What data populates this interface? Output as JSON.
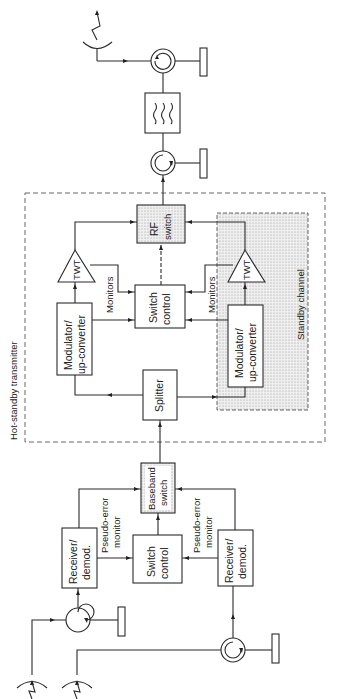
{
  "diagram": {
    "type": "block-diagram",
    "orientation": "rotated-90",
    "groups": {
      "hot_standby": "Hot-standby transmitter",
      "standby_channel": "Standby channel"
    },
    "blocks": {
      "rf_switch": [
        "RF",
        "switch"
      ],
      "switch_control_tx": [
        "Switch",
        "control"
      ],
      "twt_main": "TWT",
      "twt_standby": "TWT",
      "modulator_main": [
        "Modulator/",
        "up-converter"
      ],
      "modulator_standby": [
        "Modulator/",
        "up-converter"
      ],
      "splitter": "Splitter",
      "baseband_switch": [
        "Baseband",
        "switch"
      ],
      "switch_control_rx": [
        "Switch",
        "control"
      ],
      "receiver_main": [
        "Receiver/",
        "demod."
      ],
      "receiver_standby": [
        "Receiver/",
        "demod."
      ]
    },
    "labels": {
      "monitors_main": "Monitors",
      "monitors_standby": "Monitors",
      "pseudo_error_main": [
        "Pseudo-error",
        "monitor"
      ],
      "pseudo_error_standby": [
        "Pseudo-error",
        "monitor"
      ]
    },
    "components": [
      "transmit-antenna",
      "circulator",
      "matched-load",
      "bandpass-filter",
      "receive-antenna"
    ]
  }
}
